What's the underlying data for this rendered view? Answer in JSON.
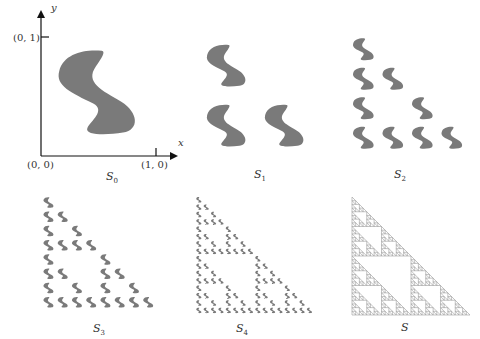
{
  "figure": {
    "panels": [
      {
        "id": "S0",
        "caption": "S",
        "subscript": "0"
      },
      {
        "id": "S1",
        "caption": "S",
        "subscript": "1"
      },
      {
        "id": "S2",
        "caption": "S",
        "subscript": "2"
      },
      {
        "id": "S3",
        "caption": "S",
        "subscript": "3"
      },
      {
        "id": "S4",
        "caption": "S",
        "subscript": "4"
      },
      {
        "id": "S",
        "caption": "S",
        "subscript": ""
      }
    ],
    "axes": {
      "x_label": "x",
      "y_label": "y",
      "origin_label": "(0, 0)",
      "x_tick_label": "(1, 0)",
      "y_tick_label": "(0, 1)"
    },
    "colors": {
      "shape": "#7a7a7a",
      "fractal": "#9a9a9a",
      "axis": "#111111"
    }
  }
}
